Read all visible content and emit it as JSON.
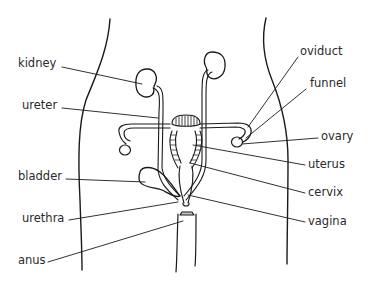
{
  "diagram": {
    "type": "anatomical line drawing",
    "colors": {
      "line": "#1a1a1a",
      "label_text": "#2a2a2a",
      "background": "#ffffff"
    },
    "labels_left": [
      {
        "id": "kidney",
        "text": "kidney"
      },
      {
        "id": "ureter",
        "text": "ureter"
      },
      {
        "id": "bladder",
        "text": "bladder"
      },
      {
        "id": "urethra",
        "text": "urethra"
      },
      {
        "id": "anus",
        "text": "anus"
      }
    ],
    "labels_right": [
      {
        "id": "oviduct",
        "text": "oviduct"
      },
      {
        "id": "funnel",
        "text": "funnel"
      },
      {
        "id": "ovary",
        "text": "ovary"
      },
      {
        "id": "uterus",
        "text": "uterus"
      },
      {
        "id": "cervix",
        "text": "cervix"
      },
      {
        "id": "vagina",
        "text": "vagina"
      }
    ]
  }
}
